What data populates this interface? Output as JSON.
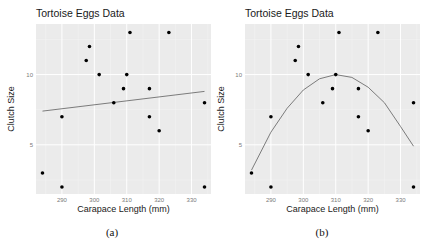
{
  "figure": {
    "captions": [
      "(a)",
      "(b)"
    ]
  },
  "chart_data": [
    {
      "type": "scatter",
      "title": "Tortoise Eggs Data",
      "xlabel": "Carapace Length (mm)",
      "ylabel": "Clutch Size",
      "xticks": [
        290,
        300,
        310,
        320,
        330
      ],
      "yticks": [
        5,
        10
      ],
      "xlim": [
        282,
        336
      ],
      "ylim": [
        1.5,
        13.6
      ],
      "grid": true,
      "points": [
        {
          "x": 284,
          "y": 3
        },
        {
          "x": 290,
          "y": 2
        },
        {
          "x": 290,
          "y": 7
        },
        {
          "x": 297.5,
          "y": 11
        },
        {
          "x": 298.5,
          "y": 12
        },
        {
          "x": 301.5,
          "y": 10
        },
        {
          "x": 306,
          "y": 8
        },
        {
          "x": 309,
          "y": 9
        },
        {
          "x": 310,
          "y": 10
        },
        {
          "x": 311,
          "y": 13
        },
        {
          "x": 317,
          "y": 9
        },
        {
          "x": 317,
          "y": 7
        },
        {
          "x": 320,
          "y": 6
        },
        {
          "x": 323,
          "y": 13
        },
        {
          "x": 334,
          "y": 8
        },
        {
          "x": 334,
          "y": 2
        }
      ],
      "fit": {
        "kind": "linear",
        "x": [
          284,
          334
        ],
        "y": [
          7.4,
          8.8
        ]
      },
      "caption": "(a)"
    },
    {
      "type": "scatter",
      "title": "Tortoise Eggs Data",
      "xlabel": "Carapace Length (mm)",
      "ylabel": "Clutch Size",
      "xticks": [
        290,
        300,
        310,
        320,
        330
      ],
      "yticks": [
        5,
        10
      ],
      "xlim": [
        282,
        336
      ],
      "ylim": [
        1.5,
        13.6
      ],
      "grid": true,
      "points": [
        {
          "x": 284,
          "y": 3
        },
        {
          "x": 290,
          "y": 2
        },
        {
          "x": 290,
          "y": 7
        },
        {
          "x": 297.5,
          "y": 11
        },
        {
          "x": 298.5,
          "y": 12
        },
        {
          "x": 301.5,
          "y": 10
        },
        {
          "x": 306,
          "y": 8
        },
        {
          "x": 309,
          "y": 9
        },
        {
          "x": 310,
          "y": 10
        },
        {
          "x": 311,
          "y": 13
        },
        {
          "x": 317,
          "y": 9
        },
        {
          "x": 317,
          "y": 7
        },
        {
          "x": 320,
          "y": 6
        },
        {
          "x": 323,
          "y": 13
        },
        {
          "x": 334,
          "y": 8
        },
        {
          "x": 334,
          "y": 2
        }
      ],
      "fit": {
        "kind": "quadratic",
        "x": [
          284,
          290,
          295,
          300,
          305,
          310,
          315,
          320,
          325,
          330,
          334
        ],
        "y": [
          3.2,
          5.9,
          7.6,
          8.9,
          9.7,
          10.0,
          9.8,
          9.1,
          8.0,
          6.3,
          4.9
        ]
      },
      "caption": "(b)"
    }
  ],
  "colors": {
    "panel": "#ebebeb",
    "grid_major": "#ffffff",
    "grid_minor": "#f3f3f3",
    "point": "#000000",
    "fit": "#6e6e6e"
  }
}
